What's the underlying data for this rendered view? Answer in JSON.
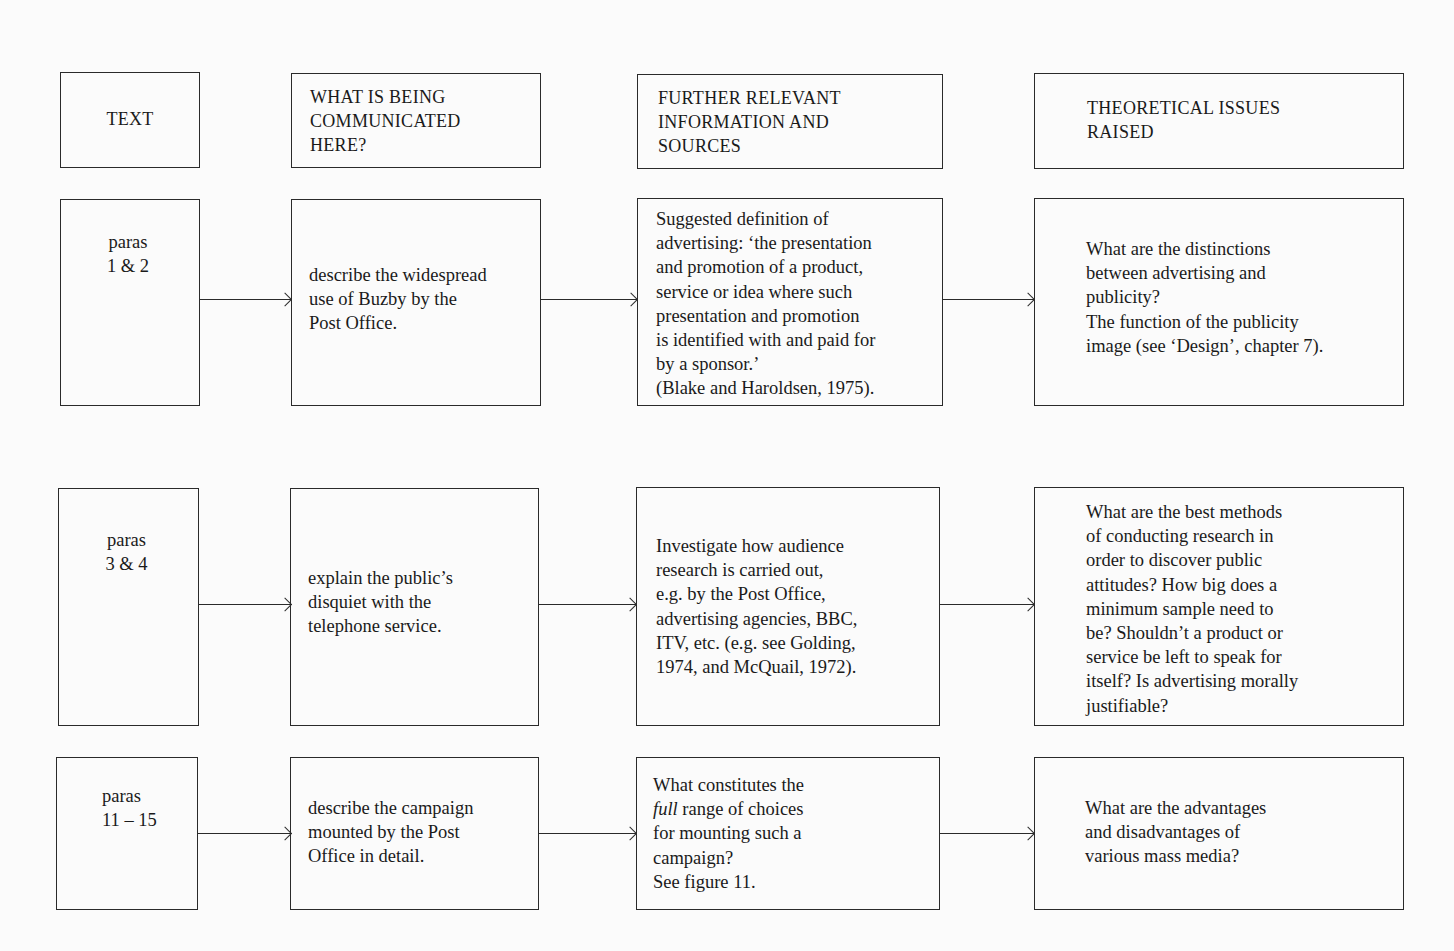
{
  "headers": {
    "col1": "TEXT",
    "col2": "WHAT IS BEING\nCOMMUNICATED\nHERE?",
    "col3": "FURTHER RELEVANT\nINFORMATION AND\nSOURCES",
    "col4": "THEORETICAL ISSUES\nRAISED"
  },
  "rows": [
    {
      "text": "paras\n1 & 2",
      "communicated": "describe the widespread\nuse of Buzby by the\nPost Office.",
      "information": "Suggested definition of\nadvertising: ‘the presentation\nand promotion of a product,\nservice or idea where such\npresentation and promotion\nis identified with and paid for\nby a sponsor.’\n(Blake and Haroldsen, 1975).",
      "issues": "What are the distinctions\nbetween advertising and\npublicity?\nThe function of the publicity\nimage (see ‘Design’, chapter 7)."
    },
    {
      "text": "paras\n3 & 4",
      "communicated": "explain the public’s\ndisquiet with the\ntelephone service.",
      "information": "Investigate how audience\nresearch is carried out,\ne.g. by the Post Office,\nadvertising agencies, BBC,\nITV, etc. (e.g. see Golding,\n1974, and McQuail, 1972).",
      "issues": "What are the best methods\nof conducting research in\norder to discover public\nattitudes? How big does a\nminimum sample need to\nbe? Shouldn’t a product or\nservice be left to speak for\nitself? Is advertising morally\njustifiable?"
    },
    {
      "text": "paras\n11 – 15",
      "communicated": "describe the campaign\nmounted by the Post\nOffice in detail.",
      "information_line1": "What constitutes the",
      "information_italic": "full",
      "information_line2_rest": " range of choices",
      "information_rest": "for mounting such a\ncampaign?\nSee figure 11.",
      "issues": "What are the advantages\nand disadvantages of\nvarious mass media?"
    }
  ],
  "colors": {
    "background": "#fbfbfb",
    "line": "#2a2a2a",
    "text": "#1a1a1a"
  }
}
